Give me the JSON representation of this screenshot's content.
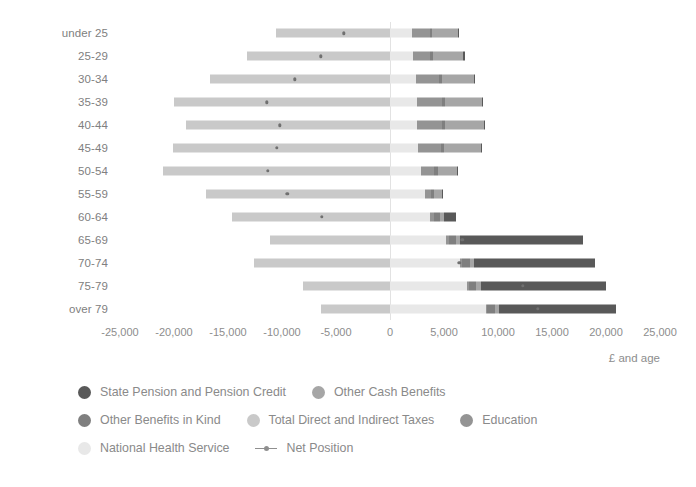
{
  "chart": {
    "axis_title": "£ and age",
    "x_ticks": [
      "-25,000",
      "-20,000",
      "-15,000",
      "-10,000",
      "-5,000",
      "0",
      "5,000",
      "10,000",
      "15,000",
      "20,000",
      "25,000"
    ]
  },
  "legend": {
    "rows": [
      [
        {
          "label": "State Pension and Pension Credit",
          "color": "#595959",
          "type": "dot"
        },
        {
          "label": "Other Cash Benefits",
          "color": "#a6a6a6",
          "type": "dot"
        }
      ],
      [
        {
          "label": "Other Benefits in Kind",
          "color": "#7f7f7f",
          "type": "dot"
        },
        {
          "label": "Total Direct and Indirect Taxes",
          "color": "#c9c9c9",
          "type": "dot"
        },
        {
          "label": "Education",
          "color": "#949494",
          "type": "dot"
        }
      ],
      [
        {
          "label": "National Health Service",
          "color": "#e8e8e8",
          "type": "dot"
        },
        {
          "label": "Net Position",
          "color": "#8f8f8f",
          "type": "line"
        }
      ]
    ]
  },
  "chart_data": {
    "type": "bar",
    "title": "",
    "subtitle": "",
    "xlabel": "£ and age",
    "ylabel": "",
    "orientation": "horizontal",
    "stacked": true,
    "diverging": true,
    "grid": false,
    "legend_position": "bottom",
    "xlim": [
      -25000,
      25000
    ],
    "xticks": [
      -25000,
      -20000,
      -15000,
      -10000,
      -5000,
      0,
      5000,
      10000,
      15000,
      20000,
      25000
    ],
    "categories": [
      "under 25",
      "25-29",
      "30-34",
      "35-39",
      "40-44",
      "45-49",
      "50-54",
      "55-59",
      "60-64",
      "65-69",
      "70-74",
      "75-79",
      "over 79"
    ],
    "series": [
      {
        "name": "Total Direct and Indirect Taxes",
        "color": "#c9c9c9",
        "side": "negative",
        "values": [
          -10600,
          -13200,
          -16700,
          -20000,
          -18900,
          -20100,
          -21000,
          -17000,
          -14600,
          -11100,
          -12600,
          -8100,
          -6400
        ]
      },
      {
        "name": "National Health Service",
        "color": "#e8e8e8",
        "side": "positive",
        "values": [
          2000,
          2100,
          2400,
          2500,
          2500,
          2600,
          2900,
          3200,
          3700,
          5200,
          6500,
          7100,
          8900
        ]
      },
      {
        "name": "Education",
        "color": "#949494",
        "side": "positive",
        "values": [
          1700,
          1600,
          2100,
          2300,
          2300,
          2100,
          1200,
          600,
          400,
          300,
          200,
          200,
          100
        ]
      },
      {
        "name": "Other Benefits in Kind",
        "color": "#7f7f7f",
        "side": "positive",
        "values": [
          200,
          300,
          300,
          300,
          300,
          300,
          300,
          300,
          500,
          600,
          700,
          700,
          700
        ]
      },
      {
        "name": "Other Cash Benefits",
        "color": "#a6a6a6",
        "side": "positive",
        "values": [
          2400,
          2800,
          3000,
          3400,
          3600,
          3400,
          1800,
          700,
          400,
          400,
          400,
          400,
          400
        ]
      },
      {
        "name": "State Pension and Pension Credit",
        "color": "#595959",
        "side": "positive",
        "values": [
          100,
          100,
          100,
          100,
          100,
          100,
          100,
          100,
          1100,
          11400,
          11200,
          11600,
          10800
        ]
      }
    ],
    "net_position": {
      "name": "Net Position",
      "color": "#707070",
      "values": [
        -4300,
        -6400,
        -8800,
        -11400,
        -10200,
        -10500,
        -11300,
        -9500,
        -6300,
        6700,
        6400,
        12300,
        13700
      ]
    }
  }
}
